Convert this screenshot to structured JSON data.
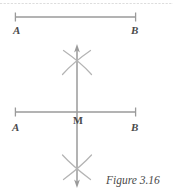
{
  "figure": {
    "caption": "Figure 3.16",
    "stroke_color": "#9a9a9a",
    "label_color": "#4a4a4a",
    "background_color": "#ffffff"
  },
  "top_segment": {
    "name": "segment-AB",
    "endpoint_left_label": "A",
    "endpoint_right_label": "B",
    "left_x": 15,
    "right_x": 136,
    "y": 17
  },
  "bottom_construction": {
    "name": "perpendicular-bisector-construction",
    "endpoint_left_label": "A",
    "endpoint_right_label": "B",
    "midpoint_label": "M",
    "left_x": 15,
    "right_x": 136,
    "y": 112,
    "vertical_x": 77,
    "vertical_top_y": 45,
    "vertical_bottom_y": 187,
    "arc_upper_cross_y": 60,
    "arc_lower_cross_y": 168
  }
}
